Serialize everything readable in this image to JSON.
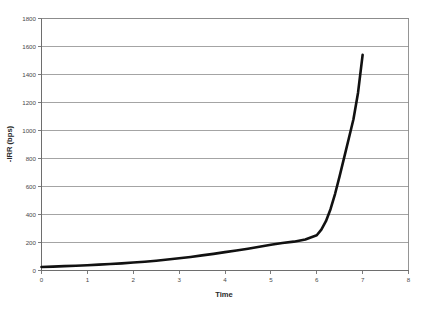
{
  "chart_data": {
    "type": "line",
    "title": "",
    "subtitle": "",
    "xlabel": "Time",
    "ylabel": "-IRR (bps)",
    "xlim": [
      0,
      8
    ],
    "ylim": [
      0,
      1800
    ],
    "grid": "horizontal",
    "legend": "none",
    "x_ticks": [
      "0",
      "1",
      "2",
      "3",
      "4",
      "5",
      "6",
      "7",
      "8"
    ],
    "x_tick_values": [
      0,
      1,
      2,
      3,
      4,
      5,
      6,
      7,
      8
    ],
    "y_ticks": [
      "0",
      "200",
      "400",
      "600",
      "800",
      "1000",
      "1200",
      "1400",
      "1600",
      "1800"
    ],
    "y_tick_values": [
      0,
      200,
      400,
      600,
      800,
      1000,
      1200,
      1400,
      1600,
      1800
    ],
    "series": [
      {
        "name": "-IRR (bps)",
        "color": "#111111",
        "line_width": 2.6,
        "x": [
          0,
          0.25,
          0.5,
          0.75,
          1,
          1.25,
          1.5,
          1.75,
          2,
          2.25,
          2.5,
          2.75,
          3,
          3.25,
          3.5,
          3.75,
          4,
          4.25,
          4.5,
          4.75,
          5,
          5.25,
          5.5,
          5.75,
          6,
          6.1,
          6.2,
          6.3,
          6.4,
          6.5,
          6.6,
          6.7,
          6.8,
          6.9,
          7
        ],
        "y": [
          25,
          28,
          31,
          34,
          38,
          42,
          46,
          51,
          57,
          63,
          70,
          78,
          87,
          97,
          108,
          119,
          131,
          143,
          156,
          170,
          184,
          196,
          206,
          222,
          252,
          292,
          352,
          438,
          548,
          676,
          810,
          945,
          1080,
          1270,
          1540
        ]
      }
    ]
  },
  "axes": {
    "y_axis_title": "-IRR (bps)",
    "x_axis_title": "Time"
  },
  "colors": {
    "background": "#ffffff",
    "gridline": "#9a9a9a",
    "axis": "#6e6e6e",
    "series": "#111111",
    "text": "#4a4a4a"
  }
}
